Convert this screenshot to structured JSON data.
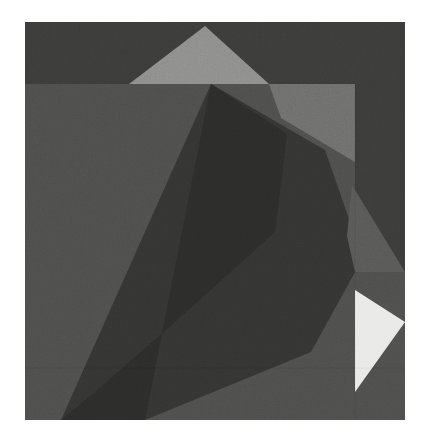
{
  "artwork": {
    "title": "Abstract Geometric Composition",
    "medium": "grayscale angular color-field study",
    "canvas": {
      "image_width": 427,
      "image_height": 442,
      "margin_color": "#ffffff",
      "art_left": 25,
      "art_top": 22,
      "art_width": 380,
      "art_height": 398
    },
    "palette": {
      "margin_white": "#ffffff",
      "near_white": "#e9e9e7",
      "light_gray": "#8d8d8b",
      "mid_light_gray": "#6e6e6c",
      "mid_gray": "#585856",
      "base_gray": "#4e4e4c",
      "dark_gray": "#3b3b3a",
      "deep_gray": "#343433",
      "darkest_gray": "#2c2c2b"
    },
    "shapes": [
      {
        "name": "background-field",
        "fill": "#3b3b3a",
        "points": "0,0 380,0 380,398 0,398",
        "description": "overall dark ground of the plate"
      },
      {
        "name": "left-lower-field",
        "fill": "#4e4e4c",
        "points": "0,62 330,62 330,398 0,398",
        "description": "large mid-gray rectangular panel occupying left and lower area"
      },
      {
        "name": "upper-light-triangle",
        "fill": "#8d8d8b",
        "points": "180,4 244,62 104,62",
        "description": "pale triangle poking above the panel edge at top center"
      },
      {
        "name": "upper-right-light-wedge",
        "fill": "#6e6e6c",
        "points": "244,62 330,62 330,140 256,96",
        "description": "lighter wedge to the right of the apex triangle"
      },
      {
        "name": "central-dark-polygon",
        "fill": "#343433",
        "points": "186,62 300,128 330,214 330,250 286,330 120,398 36,398",
        "description": "the dominant dark angular mass sweeping from top center to lower left"
      },
      {
        "name": "central-shadow-facet",
        "fill": "#2c2c2b",
        "points": "186,62 262,112 250,210 150,300 70,370 36,398 120,398",
        "description": "slightly darker inner facet of the central mass"
      },
      {
        "name": "right-mid-triangle",
        "fill": "#585856",
        "points": "327,163 380,250 330,250 322,214",
        "description": "mid-gray triangle on the right edge below the panel corner"
      },
      {
        "name": "right-bright-triangle",
        "fill": "#e9e9e7",
        "points": "330,268 380,300 330,370",
        "description": "bright near-white triangle at the lower right"
      },
      {
        "name": "right-lower-field",
        "fill": "#4e4e4c",
        "points": "330,250 380,250 380,398 330,398",
        "description": "mid-gray strip under the bright triangle at right"
      },
      {
        "name": "bottom-right-wedge",
        "fill": "#4e4e4c",
        "points": "120,398 330,398 330,330",
        "description": "mid-gray wedge along the bottom edge"
      }
    ],
    "edges": [
      {
        "name": "panel-top-edge",
        "orientation": "horizontal",
        "y": 62
      },
      {
        "name": "panel-right-edge",
        "orientation": "vertical",
        "x": 330
      },
      {
        "name": "lower-horizontal-seam",
        "orientation": "horizontal",
        "y": 346
      }
    ]
  }
}
